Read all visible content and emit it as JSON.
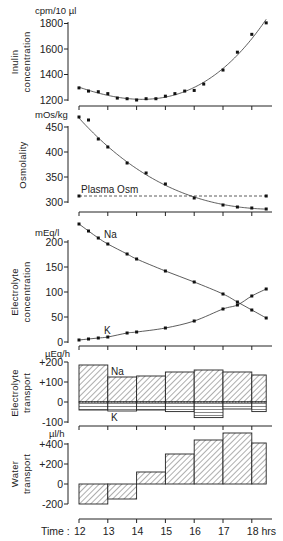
{
  "chart_data": [
    {
      "type": "scatter",
      "title": "Inulin concentration",
      "ylabel": "Inulin concentration",
      "yunit": "cpm/10 µl",
      "xlabel": "Time",
      "xunit": "hrs",
      "ylim": [
        1200,
        1800
      ],
      "yticks": [
        1200,
        1400,
        1600,
        1800
      ],
      "fit_line": true,
      "x": [
        12.0,
        12.33,
        12.67,
        13.0,
        13.33,
        13.67,
        14.0,
        14.33,
        14.67,
        15.0,
        15.33,
        15.67,
        16.0,
        16.33,
        17.0,
        17.5,
        18.0,
        18.5
      ],
      "values": [
        1295,
        1270,
        1265,
        1250,
        1215,
        1210,
        1200,
        1210,
        1210,
        1230,
        1250,
        1270,
        1275,
        1325,
        1435,
        1575,
        1715,
        1805
      ]
    },
    {
      "type": "scatter",
      "title": "Osmolality",
      "ylabel": "Osmolality",
      "yunit": "mOs/kg",
      "ylim": [
        300,
        470
      ],
      "yticks": [
        300,
        350,
        400,
        450
      ],
      "fit_line": true,
      "x": [
        12.0,
        12.33,
        12.67,
        13.0,
        13.67,
        14.33,
        15.0,
        16.0,
        17.0,
        17.5,
        18.0,
        18.5
      ],
      "values": [
        470,
        464,
        426,
        410,
        378,
        358,
        336,
        308,
        294,
        290,
        288,
        286
      ],
      "reference_line": {
        "label": "Plasma Osm",
        "value": 312,
        "x_points": [
          12.0,
          18.5
        ]
      }
    },
    {
      "type": "line",
      "title": "Electrolyte concentration",
      "ylabel": "Electrolyte concentration",
      "yunit": "mEq/l",
      "ylim": [
        0,
        236
      ],
      "yticks": [
        0,
        50,
        100,
        150,
        200
      ],
      "x": [
        12.0,
        12.33,
        12.67,
        13.0,
        13.67,
        14.0,
        15.0,
        16.0,
        17.0,
        17.5,
        18.0,
        18.5
      ],
      "series": [
        {
          "name": "Na",
          "values": [
            236,
            222,
            208,
            196,
            176,
            166,
            142,
            120,
            96,
            80,
            64,
            48
          ]
        },
        {
          "name": "K",
          "values": [
            4,
            6,
            8,
            10,
            18,
            20,
            28,
            42,
            66,
            74,
            92,
            106
          ]
        }
      ]
    },
    {
      "type": "bar",
      "title": "Electrolyte transport",
      "ylabel": "Electrolyte transport",
      "yunit": "µEq/h",
      "ylim": [
        -100,
        200
      ],
      "yticks": [
        -100,
        0,
        100,
        200
      ],
      "ytick_labels": [
        "-100",
        "0",
        "+100",
        "+200"
      ],
      "intervals": [
        [
          12,
          13
        ],
        [
          13,
          14
        ],
        [
          14,
          15
        ],
        [
          15,
          16
        ],
        [
          16,
          17
        ],
        [
          17,
          18
        ],
        [
          18,
          18.5
        ]
      ],
      "series": [
        {
          "name": "Na",
          "values": [
            185,
            125,
            130,
            150,
            160,
            150,
            135
          ]
        },
        {
          "name": "K",
          "values": [
            -40,
            -45,
            -40,
            -48,
            -78,
            -35,
            -48
          ]
        }
      ]
    },
    {
      "type": "bar",
      "title": "Water transport",
      "ylabel": "Water transport",
      "yunit": "µl/h",
      "ylim": [
        -200,
        500
      ],
      "yticks": [
        -200,
        0,
        200,
        400
      ],
      "ytick_labels": [
        "-200",
        "0",
        "+200",
        "+400"
      ],
      "intervals": [
        [
          12,
          13
        ],
        [
          13,
          14
        ],
        [
          14,
          15
        ],
        [
          15,
          16
        ],
        [
          16,
          17
        ],
        [
          17,
          18
        ],
        [
          18,
          18.5
        ]
      ],
      "values": [
        -200,
        -150,
        120,
        300,
        440,
        510,
        410
      ]
    }
  ],
  "time_axis": {
    "label": "Time :",
    "unit": "hrs",
    "ticks": [
      12,
      13,
      14,
      15,
      16,
      17,
      18
    ],
    "tick_labels": [
      "12",
      "13",
      "14",
      "15",
      "16",
      "17",
      "18 hrs"
    ]
  }
}
